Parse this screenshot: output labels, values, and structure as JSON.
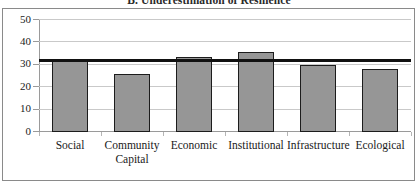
{
  "chart_data": {
    "type": "bar",
    "title": "B. Underestimation of Resilience",
    "xlabel": "",
    "ylabel": "",
    "ylim": [
      0,
      50
    ],
    "yticks": [
      "0",
      "10",
      "20",
      "30",
      "40",
      "50"
    ],
    "grid": true,
    "legend": "none",
    "categories": [
      "Social",
      "Community Capital",
      "Economic",
      "Institutional",
      "Infrastructure",
      "Ecological"
    ],
    "category_lines": [
      [
        "Social"
      ],
      [
        "Community",
        "Capital"
      ],
      [
        "Economic"
      ],
      [
        "Institutional"
      ],
      [
        "Infrastructure"
      ],
      [
        "Ecological"
      ]
    ],
    "values": [
      31.5,
      26.0,
      33.5,
      35.5,
      30.0,
      28.0
    ],
    "series": [
      {
        "name": "Underestimation of Resilience",
        "values": [
          31.5,
          26.0,
          33.5,
          35.5,
          30.0,
          28.0
        ]
      }
    ],
    "reference_line": {
      "name": "threshold-line",
      "value": 31.5,
      "orientation": "horizontal"
    },
    "colors": {
      "bar_fill": "#969696",
      "bar_edge": "#1c1c1c",
      "reference_line": "#111111",
      "gridline": "#c9c9c9",
      "axis": "#9a9a9a",
      "frame": "#8a8a8a",
      "background": "#ffffff",
      "text": "#1a1a1a"
    }
  }
}
